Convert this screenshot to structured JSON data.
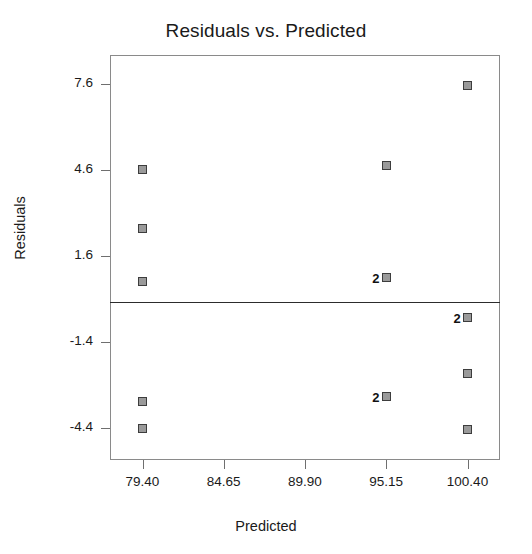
{
  "chart_data": {
    "type": "scatter",
    "title": "Residuals vs. Predicted",
    "xlabel": "Predicted",
    "ylabel": "Residuals",
    "grid": false,
    "legend": "none",
    "xlim": [
      77.3,
      102.5
    ],
    "ylim": [
      -5.5,
      8.6
    ],
    "xticks": [
      "79.40",
      "84.65",
      "89.90",
      "95.15",
      "100.40"
    ],
    "xtick_values": [
      79.4,
      84.65,
      89.9,
      95.15,
      100.4
    ],
    "yticks": [
      "7.6",
      "4.6",
      "1.6",
      "-1.4",
      "-4.4"
    ],
    "ytick_values": [
      7.6,
      4.6,
      1.6,
      -1.4,
      -4.4
    ],
    "reference_line": {
      "orientation": "horizontal",
      "y": 0.0
    },
    "points": [
      {
        "x": 79.4,
        "y": 4.6,
        "count": 1,
        "label": ""
      },
      {
        "x": 79.4,
        "y": 2.55,
        "count": 1,
        "label": ""
      },
      {
        "x": 79.4,
        "y": 0.7,
        "count": 1,
        "label": ""
      },
      {
        "x": 79.4,
        "y": -3.45,
        "count": 1,
        "label": ""
      },
      {
        "x": 79.4,
        "y": -4.4,
        "count": 1,
        "label": ""
      },
      {
        "x": 95.15,
        "y": 4.75,
        "count": 1,
        "label": ""
      },
      {
        "x": 95.15,
        "y": 0.85,
        "count": 2,
        "label": "2"
      },
      {
        "x": 95.15,
        "y": -3.3,
        "count": 2,
        "label": "2"
      },
      {
        "x": 100.4,
        "y": 7.55,
        "count": 1,
        "label": ""
      },
      {
        "x": 100.4,
        "y": -0.55,
        "count": 2,
        "label": "2"
      },
      {
        "x": 100.4,
        "y": -2.5,
        "count": 1,
        "label": ""
      },
      {
        "x": 100.4,
        "y": -4.45,
        "count": 1,
        "label": ""
      }
    ]
  },
  "colors": {
    "marker_fill": "#9a9a9a",
    "marker_edge": "#3d3d3d",
    "frame": "#8a8a8a",
    "reference_line": "#2c2c2c",
    "text": "#1a1a1a",
    "background": "#ffffff"
  }
}
